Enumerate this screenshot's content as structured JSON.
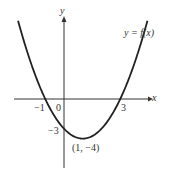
{
  "chart_data": {
    "type": "line",
    "title": "",
    "function_label": "y = f(x)",
    "xlabel": "x",
    "ylabel": "y",
    "origin_label": "0",
    "x_intercepts": [
      -1,
      3
    ],
    "y_intercept": -3,
    "vertex": {
      "x": 1,
      "y": -4,
      "label": "(1, −4)"
    },
    "tick_labels": {
      "x_neg": "−1",
      "x_pos": "3",
      "y_neg": "−3"
    },
    "x": [
      -2.4,
      -2,
      -1,
      0,
      1,
      2,
      3,
      4,
      4.4
    ],
    "y": [
      7.56,
      5,
      0,
      -3,
      -4,
      -3,
      0,
      5,
      7.56
    ],
    "grid": false
  }
}
